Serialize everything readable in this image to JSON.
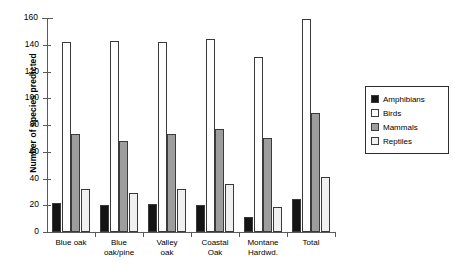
{
  "chart_data": {
    "type": "bar",
    "title": "",
    "xlabel": "",
    "ylabel": "Number of species predicted",
    "ylim": [
      0,
      160
    ],
    "yticks": [
      0,
      20,
      40,
      60,
      80,
      100,
      120,
      140,
      160
    ],
    "grid": false,
    "legend_position": "right",
    "categories": [
      "Blue oak",
      "Blue oak/pine",
      "Valley oak",
      "Coastal Oak",
      "Montane Hardwd.",
      "Total"
    ],
    "category_lines": [
      [
        "Blue oak"
      ],
      [
        "Blue",
        "oak/pine"
      ],
      [
        "Valley",
        "oak"
      ],
      [
        "Coastal",
        "Oak"
      ],
      [
        "Montane",
        "Hardwd."
      ],
      [
        "Total"
      ]
    ],
    "series": [
      {
        "name": "Amphibians",
        "color": "#141414",
        "values": [
          22,
          20,
          21,
          20,
          11,
          25
        ]
      },
      {
        "name": "Birds",
        "color": "#ffffff",
        "values": [
          142,
          143,
          142,
          144,
          131,
          159
        ]
      },
      {
        "name": "Mammals",
        "color": "#9d9d9d",
        "values": [
          73,
          68,
          73,
          77,
          70,
          89
        ]
      },
      {
        "name": "Reptiles",
        "color": "#f0f0f0",
        "values": [
          32,
          29,
          32,
          36,
          19,
          41
        ]
      }
    ]
  },
  "legend": {
    "items": [
      {
        "label": "Amphibians",
        "color": "#141414"
      },
      {
        "label": "Birds",
        "color": "#ffffff"
      },
      {
        "label": "Mammals",
        "color": "#9d9d9d"
      },
      {
        "label": "Reptiles",
        "color": "#f0f0f0"
      }
    ]
  }
}
